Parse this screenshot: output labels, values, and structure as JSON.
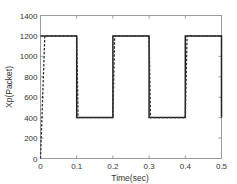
{
  "chart_data": {
    "type": "line",
    "title": "",
    "xlabel": "Time(sec)",
    "ylabel": "Xp(Packet)",
    "xlim": [
      0,
      0.5
    ],
    "ylim": [
      0,
      1400
    ],
    "xticks": [
      0,
      0.1,
      0.2,
      0.3,
      0.4,
      0.5
    ],
    "xtick_labels": [
      "0",
      "0.1",
      "0.2",
      "0.3",
      "0.4",
      "0.5"
    ],
    "yticks": [
      0,
      200,
      400,
      600,
      800,
      1000,
      1200,
      1400
    ],
    "ytick_labels": [
      "0",
      "200",
      "400",
      "600",
      "800",
      "1000",
      "1200",
      "1400"
    ],
    "grid": false,
    "legend": null,
    "series": [
      {
        "name": "reference",
        "style": "solid",
        "color": "#222222",
        "x": [
          0,
          0.005,
          0.1,
          0.1,
          0.2,
          0.2,
          0.3,
          0.3,
          0.4,
          0.4,
          0.5,
          0.5
        ],
        "y": [
          1200,
          1200,
          1200,
          400,
          400,
          1200,
          1200,
          400,
          400,
          1200,
          1200,
          400
        ]
      },
      {
        "name": "response",
        "style": "dashed",
        "color": "#333333",
        "x": [
          0,
          0.012,
          0.1,
          0.104,
          0.2,
          0.205,
          0.3,
          0.304,
          0.4,
          0.405,
          0.5
        ],
        "y": [
          0,
          1200,
          1200,
          400,
          400,
          1200,
          1200,
          400,
          400,
          1200,
          1200
        ]
      }
    ]
  }
}
